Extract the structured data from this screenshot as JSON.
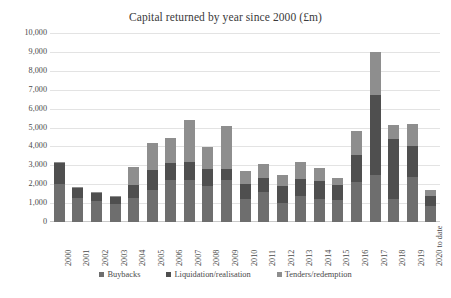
{
  "chart_data": {
    "type": "bar",
    "stacked": true,
    "title": "Capital returned by year since 2000 (£m)",
    "xlabel": "",
    "ylabel": "",
    "ylim": [
      0,
      10000
    ],
    "ytick_step": 1000,
    "ytick_labels": [
      "10,000",
      "9,000",
      "8,000",
      "7,000",
      "6,000",
      "5,000",
      "4,000",
      "3,000",
      "2,000",
      "1,000",
      "0"
    ],
    "grid": true,
    "legend_position": "bottom",
    "categories": [
      "2000",
      "2001",
      "2002",
      "2003",
      "2004",
      "2005",
      "2006",
      "2007",
      "2008",
      "2009",
      "2010",
      "2011",
      "2012",
      "2013",
      "2014",
      "2015",
      "2016",
      "2017",
      "2018",
      "2019",
      "2020 to date"
    ],
    "series": [
      {
        "name": "Buybacks",
        "color": "#6e6e6e",
        "values": [
          2000,
          1250,
          1100,
          950,
          1250,
          1700,
          2200,
          2200,
          1900,
          2200,
          1200,
          1600,
          1000,
          1400,
          1200,
          1150,
          2100,
          2500,
          1200,
          2400,
          850
        ]
      },
      {
        "name": "Liquidation/realisation",
        "color": "#4f4f4f",
        "values": [
          1100,
          550,
          450,
          400,
          700,
          1050,
          900,
          950,
          900,
          600,
          800,
          750,
          900,
          900,
          950,
          800,
          1450,
          4200,
          3200,
          1600,
          550
        ]
      },
      {
        "name": "Tenders/redemption",
        "color": "#8e8e8e",
        "values": [
          50,
          50,
          50,
          50,
          950,
          1450,
          1350,
          2250,
          1150,
          2300,
          700,
          700,
          600,
          850,
          700,
          400,
          1250,
          2300,
          750,
          1200,
          300
        ]
      }
    ],
    "totals": [
      3150,
      1850,
      1600,
      1400,
      2900,
      4200,
      4450,
      5400,
      3950,
      5100,
      2700,
      3050,
      2500,
      3150,
      2850,
      2350,
      4800,
      9000,
      5150,
      5200,
      1700
    ]
  },
  "legend": {
    "items": [
      {
        "label": "Buybacks",
        "color": "#6e6e6e"
      },
      {
        "label": "Liquidation/realisation",
        "color": "#4f4f4f"
      },
      {
        "label": "Tenders/redemption",
        "color": "#8e8e8e"
      }
    ]
  }
}
